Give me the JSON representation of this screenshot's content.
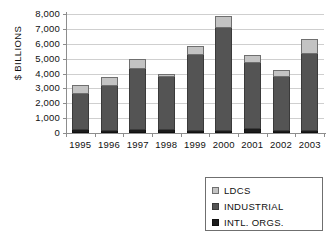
{
  "chart_data": {
    "type": "bar",
    "stacked": true,
    "title": "",
    "xlabel": "",
    "ylabel": "$ BILLIONS",
    "ylim": [
      0,
      8000
    ],
    "ytick_step": 1000,
    "ytick_labels": [
      "8,000",
      "7,000",
      "6,000",
      "5,000",
      "4,000",
      "3,000",
      "2,000",
      "1,000",
      "0"
    ],
    "ytick_values": [
      8000,
      7000,
      6000,
      5000,
      4000,
      3000,
      2000,
      1000,
      0
    ],
    "grid": true,
    "legend_position": "bottom-right",
    "categories": [
      "1995",
      "1996",
      "1997",
      "1998",
      "1999",
      "2000",
      "2001",
      "2002",
      "2003"
    ],
    "series": [
      {
        "name": "INTL. ORGS.",
        "color": "#1c1c1c",
        "values": [
          170,
          110,
          170,
          220,
          130,
          130,
          240,
          130,
          110
        ]
      },
      {
        "name": "INDUSTRIAL",
        "color": "#545454",
        "values": [
          2480,
          3060,
          4130,
          3530,
          5130,
          6930,
          4460,
          3650,
          5230
        ]
      },
      {
        "name": "LDCS",
        "color": "#c3c3c3",
        "values": [
          560,
          600,
          700,
          200,
          600,
          840,
          570,
          450,
          1010
        ]
      }
    ],
    "totals": [
      3210,
      3770,
      5000,
      3950,
      5860,
      7900,
      5270,
      4230,
      6350
    ]
  },
  "legend": {
    "items": [
      {
        "label": "LDCS",
        "swatch": "ldcs-swatch"
      },
      {
        "label": "INDUSTRIAL",
        "swatch": "industrial-swatch"
      },
      {
        "label": "INTL. ORGS.",
        "swatch": "intl-orgs-swatch"
      }
    ]
  },
  "colors": {
    "ldcs": "#c3c3c3",
    "industrial": "#545454",
    "intl_orgs": "#1c1c1c",
    "axis": "#8d8d8d",
    "grid": "#cfcfcf",
    "text": "#111111",
    "background": "#ffffff"
  }
}
